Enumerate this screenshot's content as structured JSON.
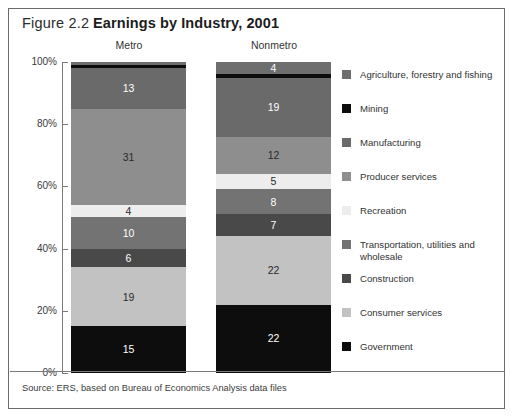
{
  "figure": {
    "number": "Figure 2.2",
    "title": "Earnings by Industry, 2001",
    "source_note": "Source: ERS, based on Bureau of Economics Analysis data files"
  },
  "chart_data": {
    "type": "bar",
    "subtype": "100% stacked column",
    "title": "Earnings by Industry, 2001",
    "xlabel": "",
    "ylabel": "",
    "ylim": [
      0,
      100
    ],
    "grid": false,
    "legend_position": "right",
    "categories": [
      "Metro",
      "Nonmetro"
    ],
    "y_ticks": [
      "0%",
      "20%",
      "40%",
      "60%",
      "80%",
      "100%"
    ],
    "series": [
      {
        "name": "Agriculture, forestry and fishing",
        "color": "#6e6e6e",
        "values": [
          1,
          4
        ],
        "labels": [
          "",
          "4"
        ]
      },
      {
        "name": "Mining",
        "color": "#0d0d0d",
        "values": [
          1,
          1
        ],
        "labels": [
          "",
          ""
        ]
      },
      {
        "name": "Manufacturing",
        "color": "#6a6a6a",
        "values": [
          13,
          19
        ],
        "labels": [
          "13",
          "19"
        ]
      },
      {
        "name": "Producer services",
        "color": "#8e8e8e",
        "values": [
          31,
          12
        ],
        "labels": [
          "31",
          "12"
        ]
      },
      {
        "name": "Recreation",
        "color": "#ededed",
        "values": [
          4,
          5
        ],
        "labels": [
          "4",
          "5"
        ]
      },
      {
        "name": "Transportation, utilities and wholesale",
        "color": "#737373",
        "values": [
          10,
          8
        ],
        "labels": [
          "10",
          "8"
        ]
      },
      {
        "name": "Construction",
        "color": "#494949",
        "values": [
          6,
          7
        ],
        "labels": [
          "6",
          "7"
        ]
      },
      {
        "name": "Consumer services",
        "color": "#c2c2c2",
        "values": [
          19,
          22
        ],
        "labels": [
          "19",
          "22"
        ]
      },
      {
        "name": "Government",
        "color": "#0d0d0d",
        "values": [
          15,
          22
        ],
        "labels": [
          "15",
          "22"
        ]
      }
    ]
  },
  "legend": {
    "items": [
      {
        "label": "Agriculture, forestry and fishing",
        "color": "#6e6e6e"
      },
      {
        "label": "Mining",
        "color": "#0d0d0d"
      },
      {
        "label": "Manufacturing",
        "color": "#6a6a6a"
      },
      {
        "label": "Producer services",
        "color": "#8e8e8e"
      },
      {
        "label": "Recreation",
        "color": "#ededed"
      },
      {
        "label": "Transportation, utilities and wholesale",
        "color": "#737373"
      },
      {
        "label": "Construction",
        "color": "#494949"
      },
      {
        "label": "Consumer services",
        "color": "#c2c2c2"
      },
      {
        "label": "Government",
        "color": "#0d0d0d"
      }
    ]
  }
}
